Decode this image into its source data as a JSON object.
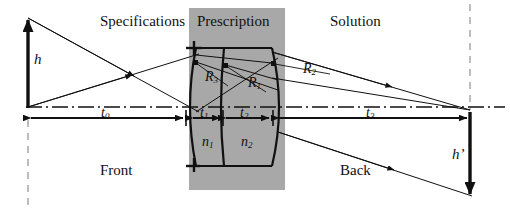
{
  "figure": {
    "type": "optical-ray-diagram",
    "width": 510,
    "height": 214,
    "background": "#ffffff"
  },
  "regions": [
    {
      "name": "specifications",
      "label": "Specifications",
      "x": 100,
      "y": 18
    },
    {
      "name": "prescription",
      "label": "Prescription",
      "x": 197,
      "y": 18
    },
    {
      "name": "solution",
      "label": "Solution",
      "x": 330,
      "y": 18
    },
    {
      "name": "front",
      "label": "Front",
      "x": 100,
      "y": 168
    },
    {
      "name": "back",
      "label": "Back",
      "x": 340,
      "y": 168
    }
  ],
  "prescription_box": {
    "fill": "#a8a8a8",
    "x": 189,
    "y": 8,
    "width": 96,
    "height": 182
  },
  "heights": [
    {
      "name": "object-height",
      "label": "h",
      "prime": false,
      "x": 34,
      "y": 57,
      "arrow": {
        "x": 28,
        "y1": 107,
        "y2": 18,
        "direction": "up"
      }
    },
    {
      "name": "image-height",
      "label": "h",
      "prime": true,
      "x": 452,
      "y": 152,
      "arrow": {
        "x": 470,
        "y1": 113,
        "y2": 196,
        "direction": "down"
      }
    }
  ],
  "distances": [
    {
      "name": "t0",
      "base": "t",
      "sub": "0",
      "x1": 28,
      "x2": 186,
      "y": 118,
      "label_x": 101,
      "label_y": 110
    },
    {
      "name": "t1",
      "base": "t",
      "sub": "1",
      "x1": 193,
      "x2": 221,
      "y": 118,
      "label_x": 200,
      "label_y": 110
    },
    {
      "name": "t2",
      "base": "t",
      "sub": "2",
      "x1": 224,
      "x2": 270,
      "y": 118,
      "label_x": 240,
      "label_y": 110
    },
    {
      "name": "t3",
      "base": "t",
      "sub": "3",
      "x1": 277,
      "x2": 470,
      "y": 118,
      "label_x": 366,
      "label_y": 110
    }
  ],
  "radii": [
    {
      "name": "R3",
      "base": "R",
      "sub": "3",
      "x": 211,
      "y": 76
    },
    {
      "name": "R1",
      "base": "R",
      "sub": "1",
      "x": 253,
      "y": 82
    },
    {
      "name": "R2",
      "base": "R",
      "sub": "2",
      "x": 308,
      "y": 69
    }
  ],
  "indices": [
    {
      "name": "n1",
      "base": "n",
      "sub": "1",
      "x": 205,
      "y": 141
    },
    {
      "name": "n2",
      "base": "n",
      "sub": "2",
      "x": 244,
      "y": 141
    }
  ],
  "optical_axis": {
    "name": "optical-axis",
    "style": "dash-dot",
    "y": 107,
    "x1": 26,
    "x2": 505
  },
  "dashed_verticals": [
    {
      "name": "object-plane",
      "x": 28,
      "y1": 120,
      "y2": 206
    },
    {
      "name": "image-plane",
      "x": 470,
      "y1": 4,
      "y2": 110
    }
  ],
  "lens": {
    "front_surface_x": 192,
    "middle_surface_x": 222,
    "back_surface_x": 277,
    "top_y": 48,
    "bottom_y": 166,
    "bulge": 10
  },
  "rays": [
    {
      "name": "ray-upper-incident",
      "from": [
        28,
        18
      ],
      "to": [
        196,
        110
      ],
      "arrow_at": 0.62
    },
    {
      "name": "ray-lower-incident",
      "from": [
        28,
        107
      ],
      "to": [
        196,
        55
      ],
      "arrow_at": 0.62
    },
    {
      "name": "ray-upper-exit",
      "from": [
        272,
        52
      ],
      "to": [
        470,
        110
      ],
      "arrow_at": 0.6
    },
    {
      "name": "ray-lower-exit",
      "from": [
        272,
        78
      ],
      "to": [
        470,
        110
      ],
      "arrow_at": 0.6
    },
    {
      "name": "ray-image-exit",
      "from": [
        278,
        132
      ],
      "to": [
        470,
        196
      ],
      "arrow_at": 0.58
    }
  ],
  "colors": {
    "ink": "#101010",
    "gray_box": "#a8a8a8",
    "dashed": "#9a9a9a",
    "paper": "#ffffff"
  }
}
